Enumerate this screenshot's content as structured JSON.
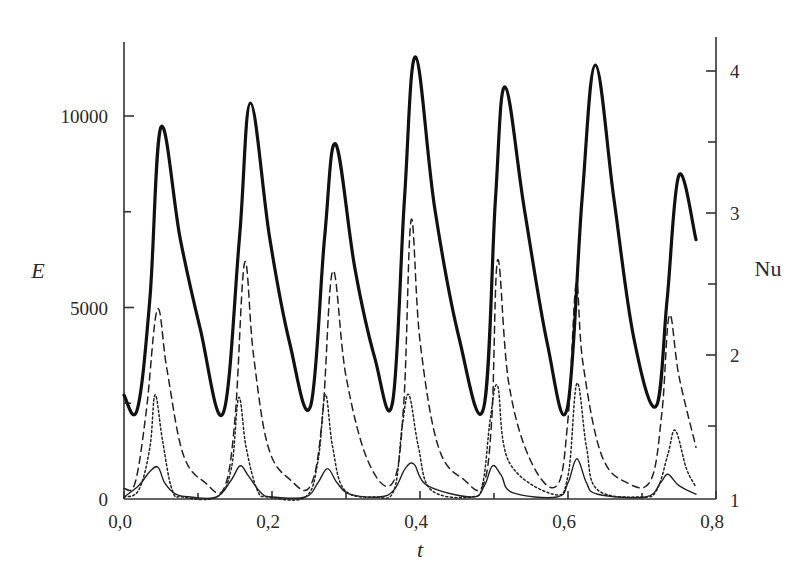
{
  "chart_data": {
    "type": "line",
    "title": "",
    "xlabel": "t",
    "ylabel": "E",
    "ylabel_right": "Nu",
    "xlim": [
      0.0,
      0.8
    ],
    "ylim": [
      0,
      12500
    ],
    "ylim_right": [
      1,
      4.25
    ],
    "grid": false,
    "legend": null,
    "x_ticks": [
      {
        "value": 0.0,
        "label": "0,0"
      },
      {
        "value": 0.2,
        "label": "0,2"
      },
      {
        "value": 0.4,
        "label": "0,4"
      },
      {
        "value": 0.6,
        "label": "0,6"
      },
      {
        "value": 0.8,
        "label": "0,8"
      }
    ],
    "x_minor_ticks": [
      0.1,
      0.3,
      0.5,
      0.7
    ],
    "y_ticks": [
      {
        "value": 0,
        "label": "0"
      },
      {
        "value": 5000,
        "label": "5000"
      },
      {
        "value": 10000,
        "label": "10000"
      }
    ],
    "y_minor_ticks": [
      2500,
      7500
    ],
    "y_right_ticks": [
      {
        "value": 1,
        "label": "1"
      },
      {
        "value": 2,
        "label": "2"
      },
      {
        "value": 3,
        "label": "3"
      },
      {
        "value": 4,
        "label": "4"
      }
    ],
    "y_right_minor_ticks": [
      1.5,
      2.5,
      3.5
    ],
    "series": [
      {
        "name": "E",
        "axis": "left",
        "style": "thick-solid",
        "x": [
          0.0,
          0.018,
          0.035,
          0.05,
          0.076,
          0.103,
          0.134,
          0.156,
          0.171,
          0.197,
          0.224,
          0.252,
          0.271,
          0.286,
          0.312,
          0.339,
          0.363,
          0.379,
          0.394,
          0.42,
          0.453,
          0.486,
          0.502,
          0.515,
          0.541,
          0.572,
          0.599,
          0.619,
          0.637,
          0.662,
          0.689,
          0.719,
          0.734,
          0.75,
          0.773
        ],
        "values": [
          2710,
          2340,
          5230,
          9710,
          6800,
          4450,
          2240,
          6800,
          10340,
          6800,
          4060,
          2420,
          6800,
          9270,
          6020,
          3670,
          2530,
          7840,
          11540,
          7580,
          4190,
          2370,
          7840,
          10760,
          7580,
          4060,
          2370,
          7840,
          11330,
          7840,
          4190,
          2420,
          5230,
          8460,
          6770
        ]
      },
      {
        "name": "Nu (dashed)",
        "axis": "right",
        "style": "dashed",
        "x": [
          0.0,
          0.015,
          0.03,
          0.045,
          0.058,
          0.08,
          0.11,
          0.135,
          0.15,
          0.163,
          0.175,
          0.195,
          0.225,
          0.252,
          0.268,
          0.282,
          0.3,
          0.33,
          0.363,
          0.378,
          0.388,
          0.4,
          0.425,
          0.46,
          0.485,
          0.497,
          0.505,
          0.52,
          0.55,
          0.585,
          0.6,
          0.611,
          0.62,
          0.645,
          0.68,
          0.712,
          0.727,
          0.737,
          0.75,
          0.773
        ],
        "values": [
          1.06,
          1.1,
          1.6,
          2.32,
          1.9,
          1.3,
          1.1,
          1.06,
          1.55,
          2.65,
          2.0,
          1.35,
          1.12,
          1.08,
          1.55,
          2.59,
          1.85,
          1.25,
          1.1,
          1.65,
          2.95,
          2.1,
          1.35,
          1.12,
          1.08,
          1.55,
          2.67,
          1.8,
          1.25,
          1.08,
          1.55,
          2.5,
          1.95,
          1.3,
          1.1,
          1.12,
          1.6,
          2.28,
          1.85,
          1.35
        ]
      },
      {
        "name": "Nu (dotted)",
        "axis": "right",
        "style": "dotted",
        "x": [
          0.0,
          0.02,
          0.035,
          0.042,
          0.052,
          0.065,
          0.08,
          0.125,
          0.145,
          0.155,
          0.165,
          0.18,
          0.195,
          0.245,
          0.262,
          0.272,
          0.282,
          0.298,
          0.34,
          0.365,
          0.376,
          0.385,
          0.398,
          0.415,
          0.47,
          0.485,
          0.495,
          0.505,
          0.52,
          0.58,
          0.6,
          0.612,
          0.625,
          0.64,
          0.7,
          0.72,
          0.735,
          0.745,
          0.76,
          0.773
        ],
        "values": [
          1.0,
          1.05,
          1.35,
          1.72,
          1.4,
          1.05,
          1.0,
          1.0,
          1.2,
          1.7,
          1.35,
          1.05,
          1.0,
          1.0,
          1.25,
          1.72,
          1.35,
          1.05,
          1.0,
          1.05,
          1.5,
          1.72,
          1.35,
          1.05,
          1.0,
          1.1,
          1.55,
          1.78,
          1.25,
          1.02,
          1.15,
          1.8,
          1.35,
          1.05,
          1.0,
          1.05,
          1.3,
          1.47,
          1.2,
          1.07
        ]
      },
      {
        "name": "Nu (thin solid)",
        "axis": "right",
        "style": "thin-solid",
        "x": [
          0.0,
          0.02,
          0.035,
          0.046,
          0.055,
          0.07,
          0.09,
          0.125,
          0.145,
          0.157,
          0.168,
          0.185,
          0.2,
          0.245,
          0.262,
          0.275,
          0.288,
          0.305,
          0.345,
          0.365,
          0.38,
          0.392,
          0.41,
          0.47,
          0.487,
          0.498,
          0.51,
          0.525,
          0.585,
          0.6,
          0.612,
          0.625,
          0.64,
          0.705,
          0.725,
          0.735,
          0.75,
          0.773
        ],
        "values": [
          1.0,
          1.08,
          1.18,
          1.21,
          1.1,
          1.02,
          1.0,
          1.0,
          1.12,
          1.22,
          1.15,
          1.03,
          1.0,
          1.0,
          1.1,
          1.2,
          1.1,
          1.02,
          1.0,
          1.05,
          1.2,
          1.23,
          1.08,
          1.0,
          1.08,
          1.22,
          1.15,
          1.03,
          1.0,
          1.1,
          1.27,
          1.1,
          1.02,
          1.0,
          1.1,
          1.16,
          1.08,
          1.02
        ]
      }
    ]
  }
}
